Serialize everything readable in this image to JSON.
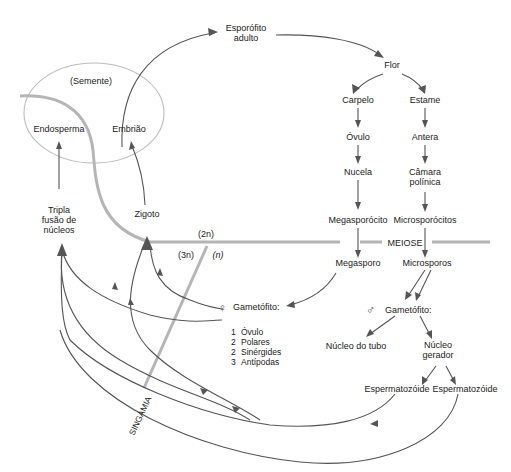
{
  "diagram": {
    "nodes": {
      "esporofito_1": "Esporófito",
      "esporofito_2": "adulto",
      "flor": "Flor",
      "carpelo": "Carpelo",
      "estame": "Estame",
      "ovulo": "Óvulo",
      "antera": "Antera",
      "nucela": "Nucela",
      "camara_1": "Câmara",
      "camara_2": "polínica",
      "megasporocito": "Megasporócito",
      "microsporocitos": "Microsporócitos",
      "meiose": "MEIOSE",
      "megasporo": "Megasporo",
      "microsporos": "Microsporos",
      "gametofito_f": "Gametófito:",
      "gametofito_m": "Gametófito:",
      "nucleo_tubo": "Núcleo do tubo",
      "nucleo_gerador_1": "Núcleo",
      "nucleo_gerador_2": "gerador",
      "esperma_1": "Espermatozóide",
      "esperma_2": "Espermatozóide",
      "semente": "(Semente)",
      "endosperma": "Endosperma",
      "embriao": "Embrião",
      "zigoto": "Zigoto",
      "tripla_1": "Tripla",
      "tripla_2": "fusão de",
      "tripla_3": "núcleos",
      "singamia": "SINGAMIA",
      "ploidy_2n": "(2n)",
      "ploidy_3n": "(3n)",
      "ploidy_n": "(n)"
    },
    "female_gametophyte_list": [
      {
        "count": "1",
        "label": "Óvulo"
      },
      {
        "count": "2",
        "label": "Polares"
      },
      {
        "count": "2",
        "label": "Sinérgides"
      },
      {
        "count": "3",
        "label": "Antípodas"
      }
    ],
    "symbols": {
      "female": "♀",
      "male": "♂"
    },
    "colors": {
      "arrow": "#555555",
      "phase_bar": "#b5b5b5",
      "seed_outline": "#bdbdbd",
      "text": "#222222"
    }
  }
}
